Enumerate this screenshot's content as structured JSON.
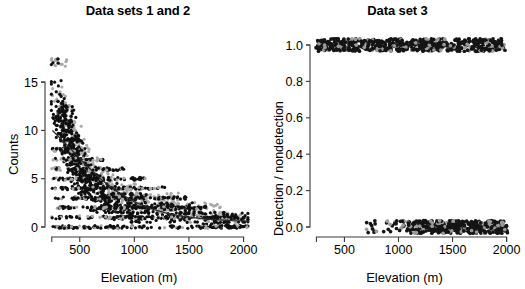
{
  "figure": {
    "width": 525,
    "height": 289,
    "background": "#ffffff"
  },
  "panels": [
    {
      "id": "left",
      "title": "Data sets 1 and 2",
      "xlabel": "Elevation (m)",
      "ylabel": "Counts",
      "xticks": [
        "500",
        "1000",
        "1500",
        "2000"
      ],
      "yticks": [
        "0",
        "5",
        "10",
        "15"
      ]
    },
    {
      "id": "right",
      "title": "Data set 3",
      "xlabel": "Elevation (m)",
      "ylabel": "Detection / nondetection",
      "xticks": [
        "500",
        "1000",
        "1500",
        "2000"
      ],
      "yticks": [
        "0.0",
        "0.2",
        "0.4",
        "0.6",
        "0.8",
        "1.0"
      ]
    }
  ],
  "chart_data": [
    {
      "type": "scatter",
      "title": "Data sets 1 and 2",
      "xlabel": "Elevation (m)",
      "ylabel": "Counts",
      "xlim": [
        200,
        2050
      ],
      "ylim": [
        0,
        17.5
      ],
      "xticks": [
        500,
        1000,
        1500,
        2000
      ],
      "yticks": [
        0,
        5,
        10,
        15
      ],
      "grid": false,
      "legend": "none",
      "series": [
        {
          "name": "Data set 1",
          "color": "#101010",
          "marker": "filled-circle",
          "note": "counts decline with elevation; jittered integer counts 0-17",
          "x": [
            255,
            270,
            285,
            300,
            300,
            315,
            320,
            330,
            335,
            340,
            345,
            350,
            355,
            360,
            365,
            370,
            375,
            380,
            385,
            390,
            395,
            400,
            405,
            410,
            415,
            420,
            425,
            430,
            435,
            440,
            445,
            450,
            455,
            460,
            465,
            470,
            475,
            480,
            485,
            490,
            495,
            500,
            505,
            510,
            515,
            520,
            525,
            530,
            540,
            550,
            560,
            570,
            580,
            590,
            600,
            610,
            620,
            630,
            640,
            650,
            660,
            670,
            680,
            690,
            700,
            710,
            720,
            730,
            740,
            750,
            760,
            780,
            800,
            820,
            840,
            860,
            880,
            900,
            920,
            940,
            960,
            980,
            1000,
            1020,
            1050,
            1080,
            1100,
            1130,
            1160,
            1190,
            1220,
            1250,
            1280,
            1310,
            1340,
            1370,
            1400,
            1430,
            1460,
            1490,
            1520,
            1550,
            1580,
            1610,
            1640,
            1670,
            1700,
            1730,
            1760,
            1790,
            1820,
            1850,
            1880,
            1910,
            1940,
            1970,
            2000
          ],
          "y": [
            17,
            15,
            14,
            13,
            12,
            12,
            11,
            11,
            12,
            10,
            13,
            11,
            10,
            9,
            11,
            10,
            12,
            9,
            8,
            10,
            9,
            11,
            8,
            7,
            9,
            10,
            8,
            7,
            9,
            6,
            8,
            7,
            9,
            6,
            8,
            5,
            7,
            6,
            8,
            5,
            7,
            6,
            4,
            7,
            5,
            6,
            4,
            5,
            6,
            4,
            5,
            3,
            6,
            4,
            5,
            3,
            4,
            5,
            2,
            4,
            3,
            5,
            2,
            4,
            3,
            2,
            4,
            3,
            2,
            3,
            2,
            4,
            2,
            3,
            1,
            3,
            2,
            3,
            1,
            2,
            3,
            1,
            2,
            1,
            3,
            1,
            2,
            2,
            1,
            2,
            1,
            2,
            1,
            2,
            1,
            2,
            1,
            1,
            2,
            1,
            1,
            2,
            1,
            1,
            1,
            0,
            1,
            1,
            0,
            1,
            1,
            0,
            1,
            0,
            1,
            0,
            1
          ]
        },
        {
          "name": "Data set 2",
          "color": "#a8a8a8",
          "marker": "filled-circle",
          "note": "overlapping grey replicate counts, same declining trend",
          "x": [
            300,
            320,
            340,
            355,
            370,
            385,
            400,
            415,
            430,
            445,
            460,
            475,
            490,
            505,
            520,
            540,
            560,
            580,
            600,
            620,
            640,
            660,
            680,
            700,
            720,
            750,
            780,
            810,
            840,
            870,
            900,
            930,
            960,
            990,
            1020,
            1060,
            1100,
            1140,
            1180,
            1220,
            1260,
            1300,
            1340,
            1380,
            1420,
            1460,
            1500,
            1540,
            1580,
            1620,
            1660,
            1700,
            1740,
            1780,
            1820,
            1860,
            1900,
            1940,
            1980
          ],
          "y": [
            17,
            14,
            13,
            12,
            12,
            11,
            10,
            11,
            9,
            10,
            8,
            9,
            8,
            7,
            8,
            6,
            7,
            6,
            7,
            5,
            6,
            5,
            6,
            4,
            5,
            4,
            5,
            3,
            4,
            3,
            4,
            3,
            4,
            2,
            3,
            3,
            2,
            3,
            2,
            3,
            2,
            2,
            3,
            2,
            2,
            1,
            2,
            1,
            2,
            1,
            2,
            1,
            1,
            2,
            1,
            1,
            1,
            1,
            0
          ]
        }
      ],
      "fit_curve": {
        "name": "fitted exponential decline",
        "color": "#2a2a2a",
        "x": [
          250,
          400,
          550,
          700,
          850,
          1000,
          1150,
          1300,
          1450,
          1600,
          1750,
          1900,
          2050
        ],
        "y": [
          10.0,
          8.3,
          6.5,
          4.9,
          3.6,
          2.6,
          1.9,
          1.4,
          1.1,
          0.9,
          0.75,
          0.65,
          0.6
        ]
      }
    },
    {
      "type": "scatter",
      "title": "Data set 3",
      "xlabel": "Elevation (m)",
      "ylabel": "Detection / nondetection",
      "xlim": [
        200,
        2050
      ],
      "ylim": [
        -0.05,
        1.05
      ],
      "xticks": [
        500,
        1000,
        1500,
        2000
      ],
      "yticks": [
        0.0,
        0.2,
        0.4,
        0.6,
        0.8,
        1.0
      ],
      "grid": false,
      "legend": "none",
      "series": [
        {
          "name": "Detections (y = 1)",
          "color": "#151515",
          "marker": "filled-circle",
          "note": "dense band of jittered 1s from ~230 m to ~2000 m, thinning above ~1600 m",
          "x_range": [
            230,
            2000
          ],
          "y_value": 1.0,
          "jitter": 0.035,
          "count": 620,
          "density_profile": "uniform-dense to 1600 m, sparser 1600-2000 m"
        },
        {
          "name": "Nondetections (y = 0)",
          "color": "#151515",
          "marker": "filled-circle",
          "note": "band of jittered 0s starting ~680 m, becoming dense above ~1100 m",
          "x_range": [
            680,
            2010
          ],
          "y_value": 0.0,
          "jitter": 0.035,
          "count": 430,
          "density_profile": "sparse 680-1050 m, dense 1100-2000 m"
        }
      ]
    }
  ]
}
